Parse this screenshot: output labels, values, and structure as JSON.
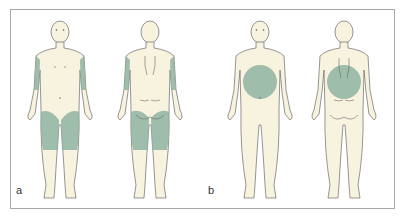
{
  "figure": {
    "panels": [
      {
        "label": "a",
        "views": [
          "front",
          "back"
        ],
        "highlighted_regions": [
          "upper arms (lateral)",
          "thighs"
        ]
      },
      {
        "label": "b",
        "views": [
          "front",
          "back"
        ],
        "highlighted_regions": [
          "abdomen",
          "lower back"
        ]
      }
    ]
  },
  "colors": {
    "skin": "#f8f3df",
    "outline": "#6a6a6a",
    "highlight": "#8fb3a2",
    "frame": "#a8a8a8"
  }
}
